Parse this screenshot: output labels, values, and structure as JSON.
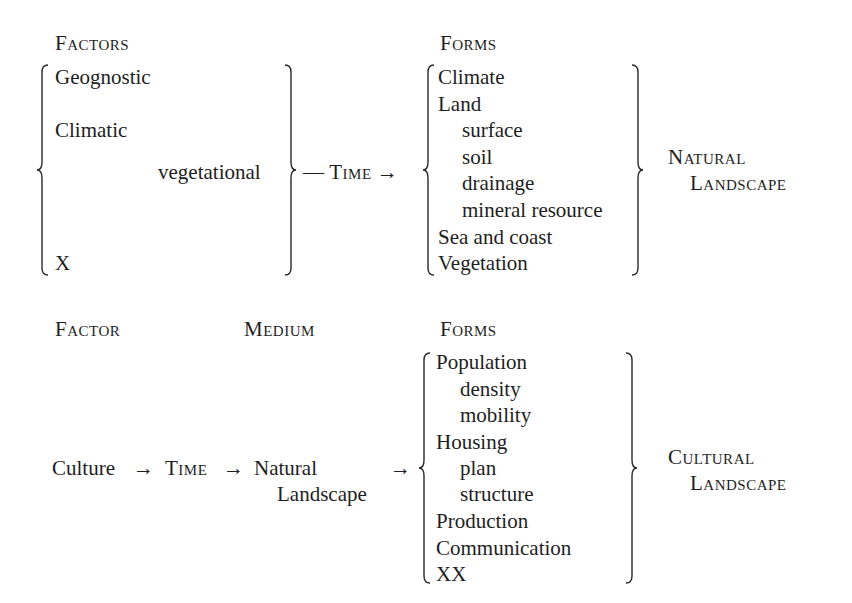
{
  "natural": {
    "factors_heading": "Factors",
    "factors": [
      "Geognostic",
      "Climatic",
      "vegetational",
      "X"
    ],
    "connector": "— Time →",
    "connector_parts": {
      "dash": "—",
      "time": "Time",
      "arrow": "→"
    },
    "forms_heading": "Forms",
    "forms": [
      {
        "label": "Climate",
        "indent": 0
      },
      {
        "label": "Land",
        "indent": 0
      },
      {
        "label": "surface",
        "indent": 1
      },
      {
        "label": "soil",
        "indent": 1
      },
      {
        "label": "drainage",
        "indent": 1
      },
      {
        "label": "mineral resource",
        "indent": 1
      },
      {
        "label": "Sea and coast",
        "indent": 0
      },
      {
        "label": "Vegetation",
        "indent": 0
      }
    ],
    "result_line1": "Natural",
    "result_line2": "Landscape"
  },
  "cultural": {
    "factor_heading": "Factor",
    "medium_heading": "Medium",
    "forms_heading": "Forms",
    "factor": "Culture",
    "arrow1": "→",
    "time": "Time",
    "arrow2": "→",
    "medium_line1": "Natural",
    "medium_line2": "Landscape",
    "arrow3": "→",
    "forms": [
      {
        "label": "Population",
        "indent": 0
      },
      {
        "label": "density",
        "indent": 1
      },
      {
        "label": "mobility",
        "indent": 1
      },
      {
        "label": "Housing",
        "indent": 0
      },
      {
        "label": "plan",
        "indent": 1
      },
      {
        "label": "structure",
        "indent": 1
      },
      {
        "label": "Production",
        "indent": 0
      },
      {
        "label": "Communication",
        "indent": 0
      },
      {
        "label": "XX",
        "indent": 0
      }
    ],
    "result_line1": "Cultural",
    "result_line2": "Landscape"
  }
}
